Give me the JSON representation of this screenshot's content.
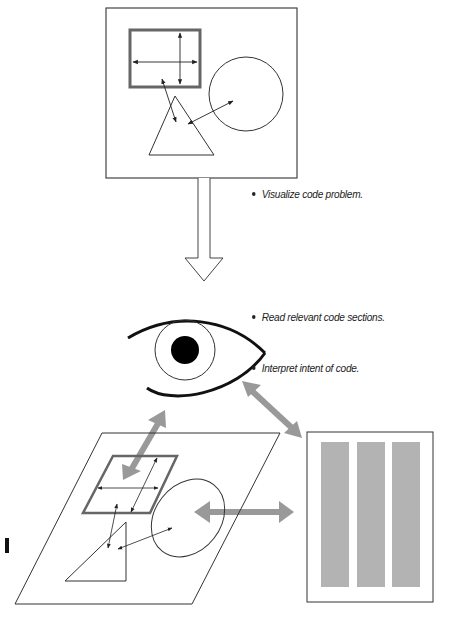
{
  "diagram": {
    "stages": [
      {
        "name": "visualize",
        "bullets": [
          "Visualize code problem."
        ]
      },
      {
        "name": "read-interpret",
        "bullets": [
          "Read relevant code sections.",
          "Interpret intent of code."
        ]
      }
    ],
    "colors": {
      "line": "#333333",
      "thick_frame": "#666666",
      "gray_arrow": "#999999",
      "code_column": "#b3b3b3",
      "background": "#ffffff"
    }
  }
}
